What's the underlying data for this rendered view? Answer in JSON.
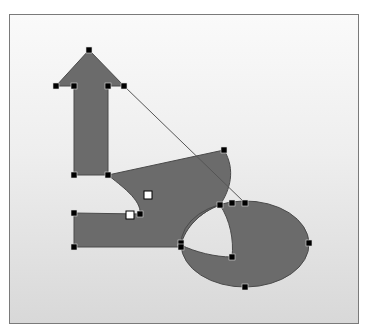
{
  "canvas": {
    "background_top": "#fafafa",
    "background_bottom": "#d8d8d8",
    "border": "#7a7a7a"
  },
  "shapes": {
    "fill": "#6b6b6b",
    "stroke": "#4a4a4a",
    "items": [
      {
        "name": "arrow-shape",
        "kind": "arrow"
      },
      {
        "name": "l-curve-shape",
        "kind": "freeform"
      },
      {
        "name": "ellipse-shape",
        "kind": "ellipse"
      }
    ]
  },
  "connector": {
    "name": "connector-line",
    "from": [
      124,
      86
    ],
    "to": [
      245,
      203
    ]
  },
  "handles": {
    "black": [
      [
        89,
        50
      ],
      [
        56,
        86
      ],
      [
        74,
        86
      ],
      [
        108,
        86
      ],
      [
        124,
        86
      ],
      [
        74,
        175
      ],
      [
        108,
        175
      ],
      [
        224,
        150
      ],
      [
        74,
        213
      ],
      [
        140,
        214
      ],
      [
        74,
        247
      ],
      [
        181,
        243
      ],
      [
        181,
        247
      ],
      [
        220,
        205
      ],
      [
        232,
        203
      ],
      [
        245,
        203
      ],
      [
        309,
        243
      ],
      [
        232,
        257
      ],
      [
        245,
        287
      ]
    ],
    "white": [
      [
        148,
        195
      ],
      [
        130,
        215
      ]
    ]
  }
}
